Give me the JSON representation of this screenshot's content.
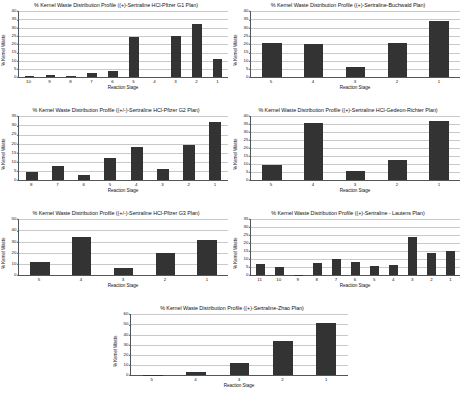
{
  "page": {
    "background": "#ffffff",
    "bar_color": "#333333",
    "grid_color": "#c9c9c9",
    "axis_color": "#555555"
  },
  "charts": [
    {
      "id": "chart-pfizer-g1",
      "chart_data": {
        "type": "bar",
        "title": "% Kernel Waste Distribution Profile ((+)-Sertraline HCl-Pfizer G1 Plan)",
        "xlabel": "Reaction Stage",
        "ylabel": "% Kernel Waste",
        "categories": [
          "10",
          "9",
          "8",
          "7",
          "6",
          "5",
          "4",
          "3",
          "2",
          "1"
        ],
        "values": [
          1,
          1.5,
          0.5,
          2.5,
          4,
          24.5,
          0,
          25,
          32,
          11
        ],
        "ylim": [
          0,
          40
        ],
        "ytick_step": 5,
        "yticks": [
          "0",
          "5",
          "10",
          "15",
          "20",
          "25",
          "30",
          "35",
          "40"
        ],
        "grid": true,
        "legend": "none"
      }
    },
    {
      "id": "chart-buchwald",
      "chart_data": {
        "type": "bar",
        "title": "% Kernel Waste Distribution Profile ((+)-Sertraline-Buchwald Plan)",
        "xlabel": "Reaction Stage",
        "ylabel": "% Kernel Waste",
        "categories": [
          "5",
          "4",
          "3",
          "2",
          "1"
        ],
        "values": [
          21,
          20,
          6,
          21,
          34
        ],
        "ylim": [
          0,
          40
        ],
        "ytick_step": 5,
        "yticks": [
          "0",
          "5",
          "10",
          "15",
          "20",
          "25",
          "30",
          "35",
          "40"
        ],
        "grid": true,
        "legend": "none"
      }
    },
    {
      "id": "chart-pfizer-g2",
      "chart_data": {
        "type": "bar",
        "title": "% Kernel Waste Distribution Profile ((+/-)-Sertraline HCl-Pfizer G2 Plan)",
        "xlabel": "Reaction Stage",
        "ylabel": "% Kernel Waste",
        "categories": [
          "8",
          "7",
          "6",
          "5",
          "4",
          "3",
          "2",
          "1"
        ],
        "values": [
          4.5,
          8,
          3,
          12,
          18,
          6,
          19.5,
          32
        ],
        "ylim": [
          0,
          35
        ],
        "ytick_step": 5,
        "yticks": [
          "0",
          "5",
          "10",
          "15",
          "20",
          "25",
          "30",
          "35"
        ],
        "grid": true,
        "legend": "none"
      }
    },
    {
      "id": "chart-gedeon-richter",
      "chart_data": {
        "type": "bar",
        "title": "% Kernel Waste Distribution Profile ((+)-Sertraline HCl-Gedeon-Richter Plan)",
        "xlabel": "Reaction Stage",
        "ylabel": "% Kernel Waste",
        "categories": [
          "5",
          "4",
          "3",
          "2",
          "1"
        ],
        "values": [
          9.5,
          36,
          6,
          12.5,
          37
        ],
        "ylim": [
          0,
          40
        ],
        "ytick_step": 5,
        "yticks": [
          "0",
          "5",
          "10",
          "15",
          "20",
          "25",
          "30",
          "35",
          "40"
        ],
        "grid": true,
        "legend": "none"
      }
    },
    {
      "id": "chart-pfizer-g3",
      "chart_data": {
        "type": "bar",
        "title": "% Kernel Waste Distribution Profile ((+/-)-Sertraline HCl-Pfizer G3 Plan)",
        "xlabel": "Reaction Stage",
        "ylabel": "% Kernel Waste",
        "categories": [
          "5",
          "4",
          "3",
          "2",
          "1"
        ],
        "values": [
          12,
          34,
          6.5,
          19.5,
          31.5
        ],
        "ylim": [
          0,
          50
        ],
        "ytick_step": 10,
        "yticks": [
          "0",
          "10",
          "20",
          "30",
          "40",
          "50"
        ],
        "grid": true,
        "legend": "none"
      }
    },
    {
      "id": "chart-lautens",
      "chart_data": {
        "type": "bar",
        "title": "% Kernel Waste Distribution Profile ((+)-Sertraline - Lautens Plan)",
        "xlabel": "Reaction Stage",
        "ylabel": "% Kernel Waste",
        "categories": [
          "11",
          "10",
          "9",
          "8",
          "7",
          "6",
          "5",
          "4",
          "3",
          "2",
          "1"
        ],
        "values": [
          7,
          5,
          0.5,
          7.5,
          10,
          8,
          5.5,
          6.5,
          24,
          14,
          15
        ],
        "ylim": [
          0,
          35
        ],
        "ytick_step": 5,
        "yticks": [
          "0",
          "5",
          "10",
          "15",
          "20",
          "25",
          "30",
          "35"
        ],
        "grid": true,
        "legend": "none"
      }
    },
    {
      "id": "chart-zhao",
      "chart_data": {
        "type": "bar",
        "title": "% Kernel Waste Distribution Profile ((+)-Sertraline-Zhao Plan)",
        "xlabel": "Reaction Stage",
        "ylabel": "% Kernel Waste",
        "categories": [
          "5",
          "4",
          "3",
          "2",
          "1"
        ],
        "values": [
          0.7,
          3,
          12.5,
          34,
          51
        ],
        "ylim": [
          0,
          60
        ],
        "ytick_step": 10,
        "yticks": [
          "0",
          "10",
          "20",
          "30",
          "40",
          "50",
          "60"
        ],
        "grid": true,
        "legend": "none"
      }
    }
  ]
}
